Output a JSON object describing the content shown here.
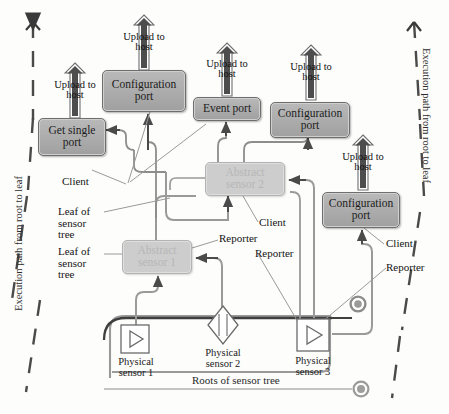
{
  "diagram": {
    "colors": {
      "port_fill": "#ababab",
      "port_border": "#6e6e6e",
      "abstract_fill": "#cdcdcd",
      "abstract_text": "#b6b6b6",
      "wire": "#8d8d8d",
      "dark_wire": "#4a4a4a",
      "arrow_fill": "#3a3a3a",
      "background": "#fdfdfc"
    }
  },
  "side_labels": {
    "left": "Execution path from root to leaf",
    "right": "Execution path from root to leaf"
  },
  "upload_arrows": [
    {
      "id": "upload-get-single-port",
      "label_line1": "Upload to",
      "label_line2": "host"
    },
    {
      "id": "upload-configuration-port-1",
      "label_line1": "Upload to",
      "label_line2": "host"
    },
    {
      "id": "upload-event-port",
      "label_line1": "Upload to",
      "label_line2": "host"
    },
    {
      "id": "upload-configuration-port-2",
      "label_line1": "Upload to",
      "label_line2": "host"
    },
    {
      "id": "upload-configuration-port-3",
      "label_line1": "Upload to",
      "label_line2": "host"
    }
  ],
  "ports": [
    {
      "id": "get-single-port",
      "line1": "Get single",
      "line2": "port"
    },
    {
      "id": "configuration-port-1",
      "line1": "Configuration",
      "line2": "port"
    },
    {
      "id": "event-port",
      "line1": "Event port",
      "line2": ""
    },
    {
      "id": "configuration-port-2",
      "line1": "Configuration",
      "line2": "port"
    },
    {
      "id": "configuration-port-3",
      "line1": "Configuration",
      "line2": "port"
    }
  ],
  "abstract_sensors": [
    {
      "id": "abstract-sensor-1",
      "line1": "Abstract",
      "line2": "sensor 1"
    },
    {
      "id": "abstract-sensor-2",
      "line1": "Abstract",
      "line2": "sensor 2"
    }
  ],
  "physical_sensors": [
    {
      "id": "physical-sensor-1",
      "line1": "Physical",
      "line2": "sensor 1",
      "glyph": "square-triangle"
    },
    {
      "id": "physical-sensor-2",
      "line1": "Physical",
      "line2": "sensor 2",
      "glyph": "diamond"
    },
    {
      "id": "physical-sensor-3",
      "line1": "Physical",
      "line2": "sensor 3",
      "glyph": "square-triangle"
    }
  ],
  "annotations": {
    "client_1": "Client",
    "client_2": "Client",
    "client_3": "Client",
    "reporter_1": "Reporter",
    "reporter_2": "Reporter",
    "reporter_3": "Reporter",
    "leaf_1": "Leaf of sensor tree",
    "leaf_2": "Leaf of sensor tree",
    "roots": "Roots of sensor tree"
  }
}
